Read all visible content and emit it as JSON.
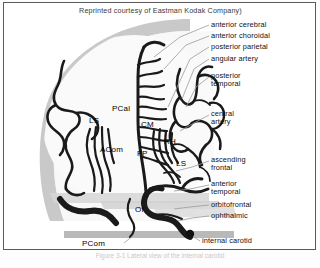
{
  "header": {
    "credit": "Reprinted courtesy of Eastman Kodak Company)"
  },
  "figure": {
    "skull_color": "#c9c9c9",
    "vessel_color": "#1a1a1a",
    "background_color": "#ffffff",
    "leader_color": "#9a9a9a"
  },
  "callouts": [
    {
      "id": "anterior-cerebral",
      "label": "anterior cerebral"
    },
    {
      "id": "anterior-choroidal",
      "label": "anterior choroidal"
    },
    {
      "id": "posterior-parietal",
      "label": "posterior parietal"
    },
    {
      "id": "angular-artery",
      "label": "angular artery"
    },
    {
      "id": "posterior-temporal",
      "label": "posterior",
      "label2": "temporal"
    },
    {
      "id": "central-artery",
      "label": "central",
      "label2": "artery"
    },
    {
      "id": "ascending-frontal",
      "label": "ascending",
      "label2": "frontal"
    },
    {
      "id": "anterior-temporal",
      "label": "anterior",
      "label2": "temporal"
    },
    {
      "id": "orbitofrontal",
      "label": "orbitofrontal"
    },
    {
      "id": "ophthalmic",
      "label": "ophthalmic"
    },
    {
      "id": "internal-carotid",
      "label": "internal carotid"
    }
  ],
  "abbreviations": [
    {
      "id": "ls-left",
      "label": "LS"
    },
    {
      "id": "pcal",
      "label": "PCal"
    },
    {
      "id": "cm",
      "label": "CM"
    },
    {
      "id": "acom",
      "label": "ACom"
    },
    {
      "id": "fp",
      "label": "FP"
    },
    {
      "id": "rh",
      "label": "RH"
    },
    {
      "id": "ls-right",
      "label": "LS"
    },
    {
      "id": "of",
      "label": "Of"
    },
    {
      "id": "pcom",
      "label": "PCom"
    }
  ],
  "bottom_caption": {
    "text": "Figure  3-1  Lateral view of the internal carotid"
  }
}
